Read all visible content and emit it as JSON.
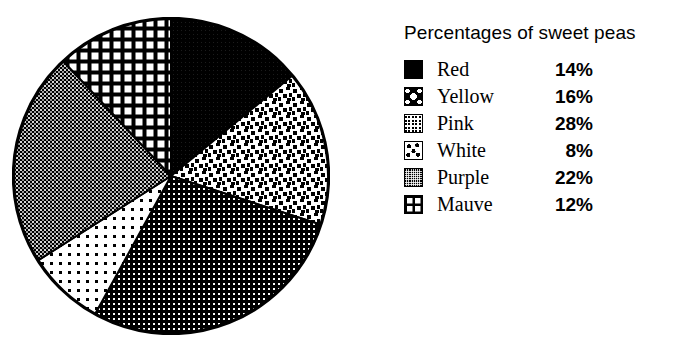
{
  "legend": {
    "title": "Percentages of sweet peas"
  },
  "chart_data": {
    "type": "pie",
    "title": "Percentages of sweet peas",
    "xlabel": "",
    "ylabel": "",
    "units": "percent",
    "total": 100,
    "start_angle_deg": 0,
    "direction": "clockwise",
    "categories": [
      "Red",
      "Yellow",
      "Pink",
      "White",
      "Purple",
      "Mauve"
    ],
    "values": [
      14,
      16,
      28,
      8,
      22,
      12
    ],
    "value_labels": [
      "14%",
      "16%",
      "28%",
      "8%",
      "22%",
      "12%"
    ],
    "legend_position": "right",
    "grid": false,
    "slices": [
      {
        "label": "Red",
        "value": 14,
        "value_label": "14%",
        "pattern": "solid-black",
        "start_deg": 0.0,
        "end_deg": 50.4
      },
      {
        "label": "Yellow",
        "value": 16,
        "value_label": "16%",
        "pattern": "scattered-squares",
        "start_deg": 50.4,
        "end_deg": 108.0
      },
      {
        "label": "Pink",
        "value": 28,
        "value_label": "28%",
        "pattern": "fine-dot-grid",
        "start_deg": 108.0,
        "end_deg": 208.8
      },
      {
        "label": "White",
        "value": 8,
        "value_label": "8%",
        "pattern": "sparse-dots",
        "start_deg": 208.8,
        "end_deg": 237.6
      },
      {
        "label": "Purple",
        "value": 22,
        "value_label": "22%",
        "pattern": "dense-crosshatch",
        "start_deg": 237.6,
        "end_deg": 316.8
      },
      {
        "label": "Mauve",
        "value": 12,
        "value_label": "12%",
        "pattern": "coarse-grid",
        "start_deg": 316.8,
        "end_deg": 360.0
      }
    ]
  },
  "colors": {
    "ink": "#000000",
    "paper": "#ffffff"
  }
}
